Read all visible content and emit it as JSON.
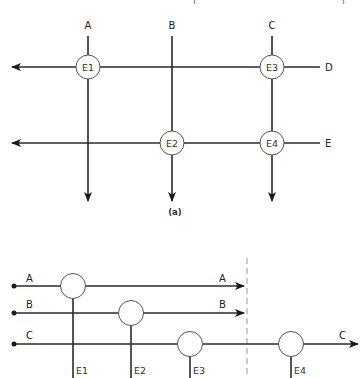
{
  "header": {
    "cutoff_text": "( )"
  },
  "diagram_a": {
    "caption": "(a)",
    "columns": [
      {
        "id": "col-a",
        "label": "A"
      },
      {
        "id": "col-b",
        "label": "B"
      },
      {
        "id": "col-c",
        "label": "C"
      }
    ],
    "rows": [
      {
        "id": "row-d",
        "label": "D"
      },
      {
        "id": "row-e",
        "label": "E"
      }
    ],
    "nodes": [
      {
        "id": "e1",
        "label": "E1",
        "column": "A",
        "row": "D"
      },
      {
        "id": "e2",
        "label": "E2",
        "column": "B",
        "row": "E"
      },
      {
        "id": "e3",
        "label": "E3",
        "column": "C",
        "row": "D"
      },
      {
        "id": "e4",
        "label": "E4",
        "column": "C",
        "row": "E"
      }
    ]
  },
  "diagram_b": {
    "inputs": [
      {
        "id": "in-a",
        "label": "A",
        "output_label": "A"
      },
      {
        "id": "in-b",
        "label": "B",
        "output_label": "B"
      },
      {
        "id": "in-c",
        "label": "C",
        "output_label": "C"
      }
    ],
    "nodes": [
      {
        "id": "e1",
        "label": "E1",
        "line": "A"
      },
      {
        "id": "e2",
        "label": "E2",
        "line": "B"
      },
      {
        "id": "e3",
        "label": "E3",
        "line": "C"
      },
      {
        "id": "e4",
        "label": "E4",
        "line": "C"
      }
    ]
  }
}
